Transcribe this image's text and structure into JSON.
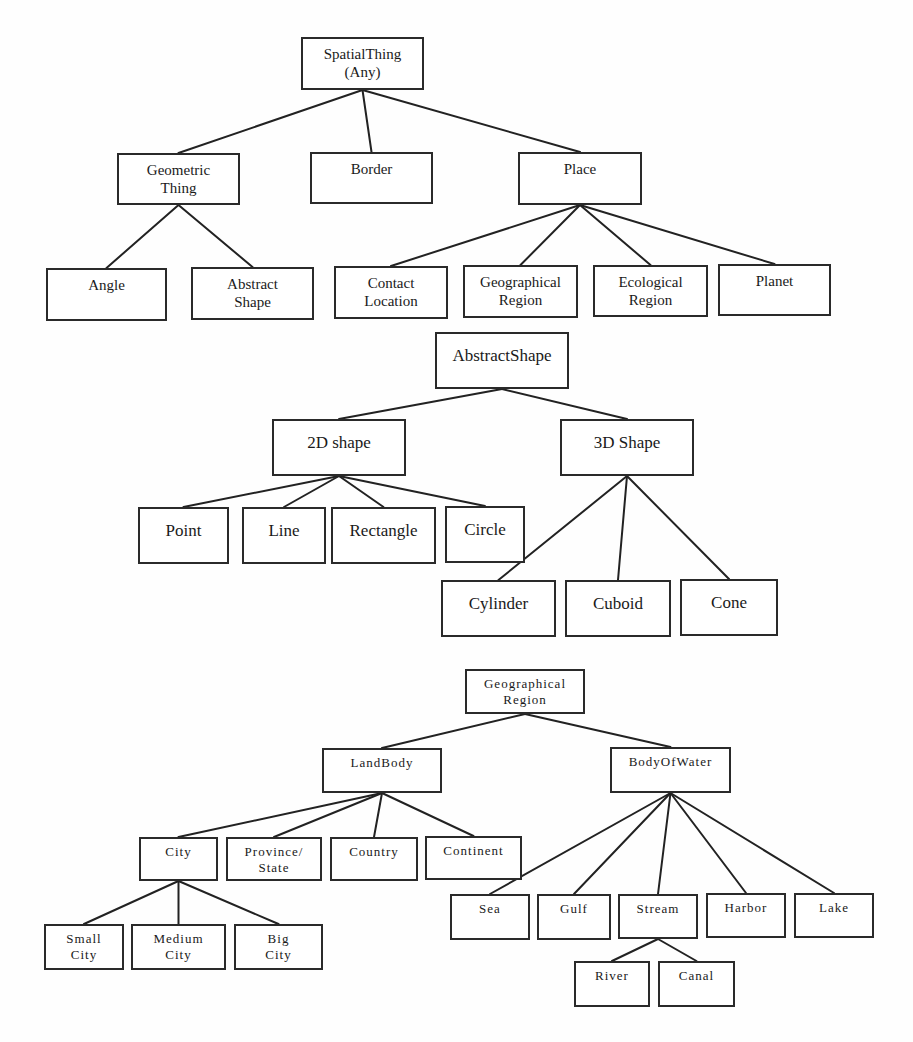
{
  "diagram": {
    "type": "hierarchy",
    "trees": [
      {
        "name": "spatial-thing-tree",
        "nodes": [
          {
            "id": "spatialthing",
            "label": "SpatialThing\n(Any)",
            "x": 301,
            "y": 37,
            "w": 123,
            "h": 53,
            "parent": null
          },
          {
            "id": "geometric-thing",
            "label": "Geometric\nThing",
            "x": 117,
            "y": 153,
            "w": 123,
            "h": 52,
            "parent": "spatialthing"
          },
          {
            "id": "border",
            "label": "Border",
            "x": 310,
            "y": 152,
            "w": 123,
            "h": 52,
            "parent": "spatialthing"
          },
          {
            "id": "place",
            "label": "Place",
            "x": 518,
            "y": 152,
            "w": 124,
            "h": 53,
            "parent": "spatialthing"
          },
          {
            "id": "angle",
            "label": "Angle",
            "x": 46,
            "y": 268,
            "w": 121,
            "h": 53,
            "parent": "geometric-thing"
          },
          {
            "id": "abstract-shape-leaf",
            "label": "Abstract\nShape",
            "x": 191,
            "y": 267,
            "w": 123,
            "h": 53,
            "parent": "geometric-thing"
          },
          {
            "id": "contact-location",
            "label": "Contact\nLocation",
            "x": 334,
            "y": 266,
            "w": 114,
            "h": 53,
            "parent": "place"
          },
          {
            "id": "geographical-region-leaf",
            "label": "Geographical\nRegion",
            "x": 463,
            "y": 265,
            "w": 115,
            "h": 53,
            "parent": "place"
          },
          {
            "id": "ecological-region",
            "label": "Ecological\nRegion",
            "x": 593,
            "y": 265,
            "w": 115,
            "h": 52,
            "parent": "place"
          },
          {
            "id": "planet",
            "label": "Planet",
            "x": 718,
            "y": 264,
            "w": 113,
            "h": 52,
            "parent": "place"
          }
        ]
      },
      {
        "name": "abstract-shape-tree",
        "nodes": [
          {
            "id": "abstractshape",
            "label": "AbstractShape",
            "x": 435,
            "y": 332,
            "w": 134,
            "h": 57,
            "parent": null
          },
          {
            "id": "2d-shape",
            "label": "2D shape",
            "x": 272,
            "y": 419,
            "w": 134,
            "h": 57,
            "parent": "abstractshape"
          },
          {
            "id": "3d-shape",
            "label": "3D Shape",
            "x": 560,
            "y": 419,
            "w": 134,
            "h": 57,
            "parent": "abstractshape"
          },
          {
            "id": "point",
            "label": "Point",
            "x": 138,
            "y": 507,
            "w": 91,
            "h": 57,
            "parent": "2d-shape"
          },
          {
            "id": "line",
            "label": "Line",
            "x": 242,
            "y": 507,
            "w": 84,
            "h": 57,
            "parent": "2d-shape"
          },
          {
            "id": "rectangle",
            "label": "Rectangle",
            "x": 331,
            "y": 507,
            "w": 105,
            "h": 57,
            "parent": "2d-shape"
          },
          {
            "id": "circle",
            "label": "Circle",
            "x": 445,
            "y": 506,
            "w": 80,
            "h": 57,
            "parent": "2d-shape"
          },
          {
            "id": "cylinder",
            "label": "Cylinder",
            "x": 441,
            "y": 580,
            "w": 115,
            "h": 57,
            "parent": "3d-shape"
          },
          {
            "id": "cuboid",
            "label": "Cuboid",
            "x": 565,
            "y": 580,
            "w": 106,
            "h": 57,
            "parent": "3d-shape"
          },
          {
            "id": "cone",
            "label": "Cone",
            "x": 680,
            "y": 579,
            "w": 98,
            "h": 57,
            "parent": "3d-shape"
          }
        ]
      },
      {
        "name": "geographical-region-tree",
        "nodes": [
          {
            "id": "geographical-region",
            "label": "Geographical\nRegion",
            "x": 465,
            "y": 669,
            "w": 120,
            "h": 45,
            "parent": null
          },
          {
            "id": "landbody",
            "label": "LandBody",
            "x": 322,
            "y": 748,
            "w": 120,
            "h": 45,
            "parent": "geographical-region"
          },
          {
            "id": "bodyofwater",
            "label": "BodyOfWater",
            "x": 610,
            "y": 747,
            "w": 121,
            "h": 46,
            "parent": "geographical-region"
          },
          {
            "id": "city",
            "label": "City",
            "x": 139,
            "y": 837,
            "w": 79,
            "h": 44,
            "parent": "landbody"
          },
          {
            "id": "province-state",
            "label": "Province/\nState",
            "x": 226,
            "y": 837,
            "w": 96,
            "h": 44,
            "parent": "landbody"
          },
          {
            "id": "country",
            "label": "Country",
            "x": 330,
            "y": 837,
            "w": 88,
            "h": 44,
            "parent": "landbody"
          },
          {
            "id": "continent",
            "label": "Continent",
            "x": 425,
            "y": 836,
            "w": 97,
            "h": 44,
            "parent": "landbody"
          },
          {
            "id": "small-city",
            "label": "Small\nCity",
            "x": 44,
            "y": 924,
            "w": 80,
            "h": 46,
            "parent": "city"
          },
          {
            "id": "medium-city",
            "label": "Medium\nCity",
            "x": 131,
            "y": 924,
            "w": 95,
            "h": 46,
            "parent": "city"
          },
          {
            "id": "big-city",
            "label": "Big\nCity",
            "x": 234,
            "y": 924,
            "w": 89,
            "h": 46,
            "parent": "city"
          },
          {
            "id": "sea",
            "label": "Sea",
            "x": 450,
            "y": 894,
            "w": 80,
            "h": 46,
            "parent": "bodyofwater"
          },
          {
            "id": "gulf",
            "label": "Gulf",
            "x": 537,
            "y": 894,
            "w": 74,
            "h": 46,
            "parent": "bodyofwater"
          },
          {
            "id": "stream",
            "label": "Stream",
            "x": 618,
            "y": 894,
            "w": 80,
            "h": 45,
            "parent": "bodyofwater"
          },
          {
            "id": "harbor",
            "label": "Harbor",
            "x": 706,
            "y": 893,
            "w": 80,
            "h": 45,
            "parent": "bodyofwater"
          },
          {
            "id": "lake",
            "label": "Lake",
            "x": 794,
            "y": 893,
            "w": 80,
            "h": 45,
            "parent": "bodyofwater"
          },
          {
            "id": "river",
            "label": "River",
            "x": 574,
            "y": 961,
            "w": 76,
            "h": 46,
            "parent": "stream"
          },
          {
            "id": "canal",
            "label": "Canal",
            "x": 658,
            "y": 961,
            "w": 77,
            "h": 46,
            "parent": "stream"
          }
        ]
      }
    ]
  }
}
